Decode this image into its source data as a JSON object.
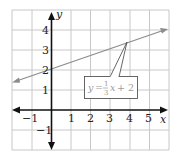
{
  "graph": {
    "x_axis_label": "x",
    "y_axis_label": "y",
    "x_range": [
      -2,
      6
    ],
    "y_range": [
      -2,
      5
    ],
    "x_ticks": [
      {
        "value": -1,
        "label": "−1"
      },
      {
        "value": 1,
        "label": "1"
      },
      {
        "value": 2,
        "label": "2"
      },
      {
        "value": 3,
        "label": "3"
      },
      {
        "value": 4,
        "label": "4"
      },
      {
        "value": 5,
        "label": "5"
      }
    ],
    "y_ticks": [
      {
        "value": -1,
        "label": "−1"
      },
      {
        "value": 1,
        "label": "1"
      },
      {
        "value": 2,
        "label": "2"
      },
      {
        "value": 3,
        "label": "3"
      },
      {
        "value": 4,
        "label": "4"
      }
    ],
    "line": {
      "slope_num": 1,
      "slope_den": 3,
      "intercept": 2,
      "color": "#8c8c8c"
    },
    "callout": {
      "y_var": "y",
      "equals": "=",
      "frac_num": "1",
      "frac_den": "3",
      "x_var": "x",
      "rest": "+ 2",
      "text_color": "#9a9a9a"
    },
    "colors": {
      "grid": "#c8c8c8",
      "axis": "#111111"
    }
  }
}
